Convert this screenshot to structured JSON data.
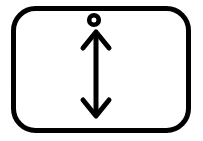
{
  "canvas": {
    "width": 203,
    "height": 141,
    "background_color": "#ffffff"
  },
  "icon": {
    "name": "vertical-double-arrow-with-dot-icon",
    "label": "Vertical double-headed arrow with dot inside rounded rectangle",
    "stroke_color": "#000000",
    "fill_color": "#ffffff"
  },
  "frame": {
    "name": "rounded-rectangle-border",
    "x": 11,
    "y": 6,
    "width": 180,
    "height": 127,
    "corner_radius": 22,
    "stroke_width": 5,
    "stroke_color": "#000000",
    "fill_color": "#ffffff"
  },
  "dot": {
    "name": "ring-dot",
    "center_x": 94,
    "center_y": 20,
    "outer_radius": 7,
    "inner_radius": 2.6,
    "stroke_width": 4.6,
    "stroke_color": "#000000"
  },
  "arrow": {
    "name": "double-headed-vertical-arrow",
    "shaft_x": 96,
    "shaft_top_y": 34,
    "shaft_bottom_y": 114,
    "stroke_width": 5,
    "stroke_color": "#000000",
    "head_half_width": 13,
    "head_height": 16,
    "head_top": {
      "tip_x": 96,
      "tip_y": 32,
      "left_x": 83,
      "left_y": 48,
      "right_x": 109,
      "right_y": 48
    },
    "head_bottom": {
      "tip_x": 96,
      "tip_y": 116,
      "left_x": 83,
      "left_y": 100,
      "right_x": 109,
      "right_y": 100
    }
  }
}
